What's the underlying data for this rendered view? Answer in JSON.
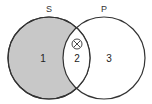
{
  "diagram": {
    "type": "venn",
    "circles": [
      {
        "label": "S",
        "cx": 49,
        "cy": 58,
        "r": 41,
        "fill": "#c8c8c8",
        "stroke": "#333333"
      },
      {
        "label": "P",
        "cx": 104,
        "cy": 58,
        "r": 41,
        "fill": "none",
        "stroke": "#333333"
      }
    ],
    "regions": [
      {
        "label": "1",
        "x": 43,
        "y": 62
      },
      {
        "label": "2",
        "x": 77,
        "y": 62
      },
      {
        "label": "3",
        "x": 109,
        "y": 62
      }
    ],
    "marker": {
      "symbol": "⊗",
      "x": 77,
      "y": 46
    }
  }
}
